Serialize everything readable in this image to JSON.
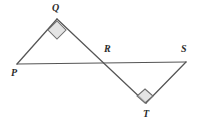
{
  "figure": {
    "background_color": "#ffffff",
    "line_color": "#555555",
    "label_color": "#2b2b2b",
    "right_angle_fill": "#d9d9d9",
    "right_angle_stroke": "#6e6e6e",
    "width": 205,
    "height": 129
  },
  "vertices": {
    "P": {
      "label": "P",
      "x": 17,
      "y": 64,
      "label_x": 11,
      "label_y": 68
    },
    "Q": {
      "label": "Q",
      "x": 57,
      "y": 19,
      "label_x": 52,
      "label_y": 3
    },
    "R": {
      "label": "R",
      "x": 106,
      "y": 60,
      "label_x": 104,
      "label_y": 44
    },
    "S": {
      "label": "S",
      "x": 186,
      "y": 62,
      "label_x": 181,
      "label_y": 44
    },
    "T": {
      "label": "T",
      "x": 146,
      "y": 103,
      "label_x": 143,
      "label_y": 109
    }
  },
  "segments": [
    {
      "name": "segment-PS",
      "from": "P",
      "to": "S",
      "d": "M 17 64 L 186 62"
    },
    {
      "name": "segment-PQ",
      "from": "P",
      "to": "Q",
      "d": "M 17 64 L 57 19"
    },
    {
      "name": "segment-QT",
      "from": "Q",
      "to": "T",
      "d": "M 57 19 L 146 103"
    },
    {
      "name": "segment-TS",
      "from": "T",
      "to": "S",
      "d": "M 146 103 L 186 62"
    }
  ],
  "right_angles": [
    {
      "name": "right-angle-marker-Q",
      "at": "Q",
      "points": "57,21 66,30 57,39 48,30"
    },
    {
      "name": "right-angle-marker-T",
      "at": "T",
      "points": "145,89 153,96 145,103 137,96"
    }
  ]
}
